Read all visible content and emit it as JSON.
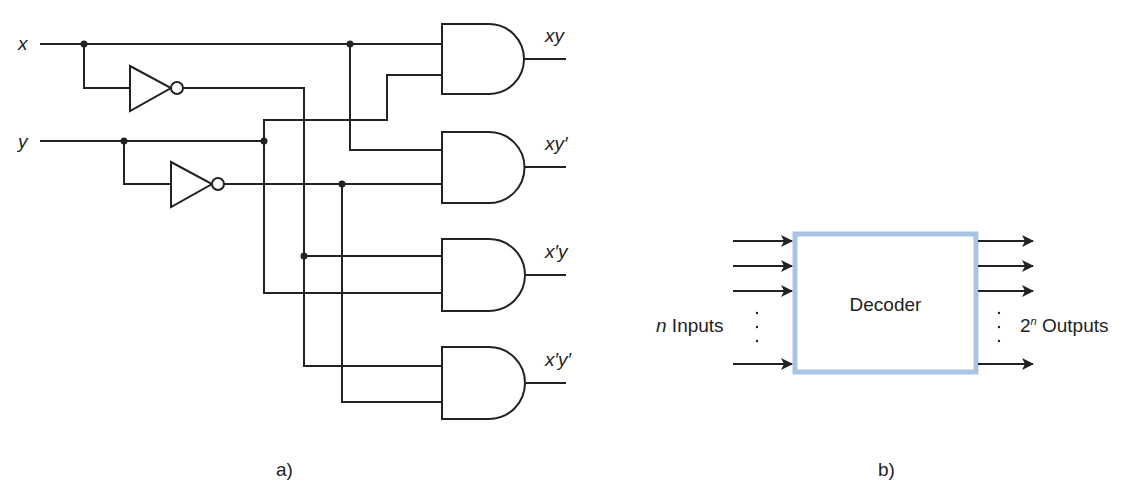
{
  "panel_a": {
    "caption": "a)",
    "inputs": [
      {
        "label": "x"
      },
      {
        "label": "y"
      }
    ],
    "outputs": [
      {
        "label": "xy"
      },
      {
        "label": "xy′"
      },
      {
        "label": "x′y"
      },
      {
        "label": "x′y′"
      }
    ],
    "gates": {
      "inverters": 2,
      "and_gates": 4
    }
  },
  "panel_b": {
    "caption": "b)",
    "block_label": "Decoder",
    "inputs_prefix": "n",
    "inputs_label": " Inputs",
    "outputs_base": "2",
    "outputs_exp": "n",
    "outputs_label": " Outputs",
    "dots": ".",
    "box_color": "#a9c3e4"
  }
}
